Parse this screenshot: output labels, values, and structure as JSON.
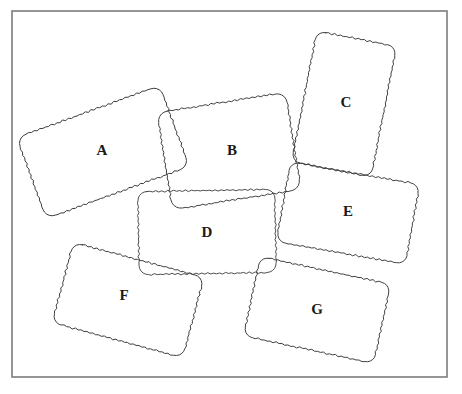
{
  "figure": {
    "background_color": "#ffffff",
    "frame": {
      "name": "outer-frame",
      "stroke_color": "#7c7c7c",
      "x": 12,
      "y": 11,
      "width": 435,
      "height": 366
    },
    "stroke_color": "#3a3a3a",
    "label_color": "#1a1a1a",
    "edge_style": "wavy-hand-drawn",
    "fill": "transparent"
  },
  "shapes": [
    {
      "id": "A",
      "label": "A",
      "name": "rectangle-a",
      "center_x": 103,
      "center_y": 152,
      "width": 152,
      "height": 86,
      "rotation_deg": -20,
      "label_x": 102,
      "label_y": 152,
      "z_order": 1
    },
    {
      "id": "B",
      "label": "B",
      "name": "rectangle-b",
      "center_x": 229,
      "center_y": 151,
      "width": 130,
      "height": 98,
      "rotation_deg": -9,
      "label_x": 232,
      "label_y": 152,
      "z_order": 2
    },
    {
      "id": "C",
      "label": "C",
      "name": "rectangle-c",
      "center_x": 344,
      "center_y": 104,
      "width": 81,
      "height": 133,
      "rotation_deg": 11,
      "label_x": 346,
      "label_y": 104,
      "z_order": 3
    },
    {
      "id": "D",
      "label": "D",
      "name": "rectangle-d",
      "center_x": 207,
      "center_y": 232,
      "width": 137,
      "height": 83,
      "rotation_deg": -1,
      "label_x": 207,
      "label_y": 234,
      "z_order": 4
    },
    {
      "id": "E",
      "label": "E",
      "name": "rectangle-e",
      "center_x": 348,
      "center_y": 213,
      "width": 131,
      "height": 81,
      "rotation_deg": 10,
      "label_x": 348,
      "label_y": 213,
      "z_order": 5
    },
    {
      "id": "F",
      "label": "F",
      "name": "rectangle-f",
      "center_x": 128,
      "center_y": 300,
      "width": 135,
      "height": 83,
      "rotation_deg": 15,
      "label_x": 124,
      "label_y": 297,
      "z_order": 6
    },
    {
      "id": "G",
      "label": "G",
      "name": "rectangle-g",
      "center_x": 317,
      "center_y": 310,
      "width": 133,
      "height": 81,
      "rotation_deg": 12,
      "label_x": 317,
      "label_y": 311,
      "z_order": 7
    }
  ]
}
